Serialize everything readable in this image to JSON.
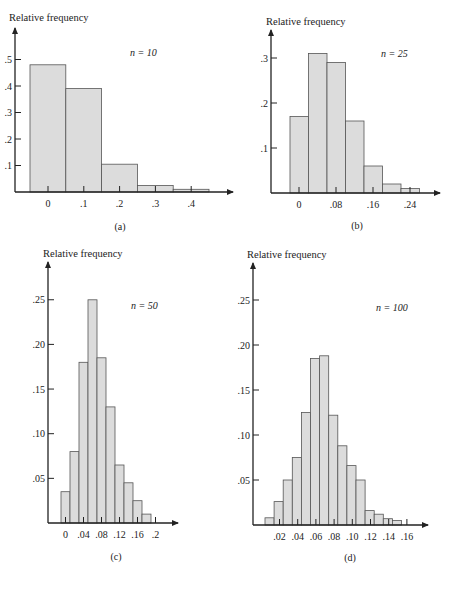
{
  "chart_data": [
    {
      "panel": "(a)",
      "type": "bar",
      "title": "",
      "annotation": "n = 10",
      "ylabel": "Relative frequency",
      "xlabel": "",
      "x_ticks": [
        "0",
        ".1",
        ".2",
        ".3",
        ".4"
      ],
      "y_ticks": [
        ".1",
        ".2",
        ".3",
        ".4",
        ".5"
      ],
      "categories": [
        0,
        0.1,
        0.2,
        0.3,
        0.4
      ],
      "values": [
        0.48,
        0.39,
        0.105,
        0.025,
        0.01
      ],
      "ylim": [
        0,
        0.55
      ],
      "grid": false,
      "geom": {
        "ox": 15,
        "oy": 192,
        "x0": 30,
        "bw": 35.8,
        "tick_x0": 48,
        "tick_dx": 35.8,
        "ypx": 265,
        "ymax_px": 35,
        "xend": 233
      }
    },
    {
      "panel": "(b)",
      "type": "bar",
      "annotation": "n = 25",
      "ylabel": "Relative frequency",
      "x_ticks": [
        "0",
        ".08",
        ".16",
        ".24"
      ],
      "y_ticks": [
        ".1",
        ".2",
        ".3"
      ],
      "categories": [
        0,
        0.04,
        0.08,
        0.12,
        0.16,
        0.2,
        0.24
      ],
      "values": [
        0.17,
        0.31,
        0.29,
        0.16,
        0.06,
        0.02,
        0.01
      ],
      "ylim": [
        0,
        0.35
      ],
      "grid": false,
      "geom": {
        "ox": 271,
        "oy": 193,
        "x0": 290,
        "bw": 18.5,
        "tick_x0": 299,
        "tick_dx": 37,
        "ypx": 450,
        "ymax_px": 32,
        "xend": 440
      }
    },
    {
      "panel": "(c)",
      "type": "bar",
      "annotation": "n = 50",
      "ylabel": "Relative frequency",
      "x_ticks": [
        "0",
        ".04",
        ".08",
        ".12",
        ".16",
        ".2"
      ],
      "y_ticks": [
        ".05",
        ".10",
        ".15",
        ".20",
        ".25"
      ],
      "categories": [
        0,
        0.02,
        0.04,
        0.06,
        0.08,
        0.1,
        0.12,
        0.14,
        0.16,
        0.18
      ],
      "values": [
        0.035,
        0.08,
        0.18,
        0.25,
        0.185,
        0.13,
        0.065,
        0.045,
        0.025,
        0.01
      ],
      "ylim": [
        0,
        0.28
      ],
      "grid": false,
      "geom": {
        "ox": 48,
        "oy": 523,
        "x0": 61,
        "bw": 9,
        "tick_x0": 65.5,
        "tick_dx": 18,
        "ypx": 893,
        "ymax_px": 267,
        "xend": 178
      }
    },
    {
      "panel": "(d)",
      "type": "bar",
      "annotation": "n = 100",
      "ylabel": "Relative frequency",
      "x_ticks": [
        ".02",
        ".04",
        ".06",
        ".08",
        ".10",
        ".12",
        ".14",
        ".16"
      ],
      "y_ticks": [
        ".05",
        ".10",
        ".15",
        ".20",
        ".25"
      ],
      "categories": [
        0.005,
        0.015,
        0.025,
        0.035,
        0.045,
        0.055,
        0.065,
        0.075,
        0.085,
        0.095,
        0.105,
        0.115,
        0.125,
        0.135,
        0.145
      ],
      "values": [
        0.008,
        0.026,
        0.05,
        0.075,
        0.125,
        0.185,
        0.188,
        0.122,
        0.088,
        0.066,
        0.05,
        0.016,
        0.012,
        0.007,
        0.005
      ],
      "ylim": [
        0,
        0.28
      ],
      "grid": false,
      "geom": {
        "ox": 253,
        "oy": 525,
        "x0": 265,
        "bw": 9.1,
        "tick_x0": 279.5,
        "tick_dx": 18.2,
        "ypx": 900,
        "ymax_px": 265,
        "xend": 428
      }
    }
  ],
  "panels": {
    "a": {
      "ylabel": "Relative frequency",
      "annotation": "n = 10",
      "caption": "(a)"
    },
    "b": {
      "ylabel": "Relative frequency",
      "annotation": "n = 25",
      "caption": "(b)"
    },
    "c": {
      "ylabel": "Relative frequency",
      "annotation": "n = 50",
      "caption": "(c)"
    },
    "d": {
      "ylabel": "Relative frequency",
      "annotation": "n = 100",
      "caption": "(d)"
    }
  }
}
